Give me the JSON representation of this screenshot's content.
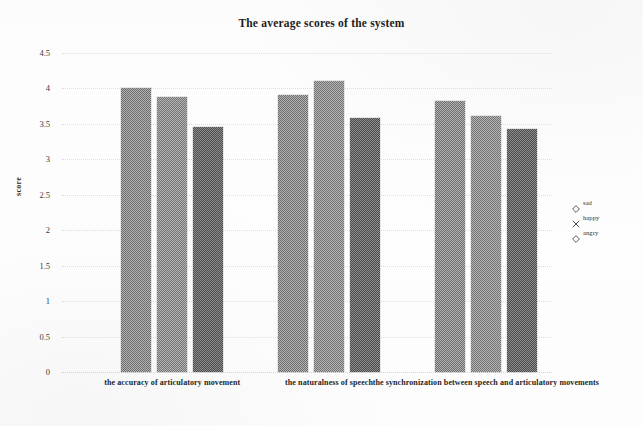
{
  "chart_data": {
    "type": "bar",
    "title": "The average scores of the system",
    "xlabel": "",
    "ylabel": "score",
    "ylim": [
      0,
      4.5
    ],
    "ytick_labels": [
      "4.5",
      "4",
      "3.5",
      "3",
      "2.5",
      "2",
      "1.5",
      "1",
      "0.5",
      "0"
    ],
    "yticks": [
      4.5,
      4,
      3.5,
      3,
      2.5,
      2,
      1.5,
      1,
      0.5,
      0
    ],
    "grid": true,
    "legend_position": "right",
    "categories": [
      "the accuracy of articulatory movement",
      "the naturalness of speech",
      "the synchronization between speech and articulatory movements"
    ],
    "series": [
      {
        "name": "sad",
        "marker": "diamond-marker",
        "values": [
          4.01,
          3.91,
          3.82
        ]
      },
      {
        "name": "happy",
        "marker": "cross-marker",
        "values": [
          3.88,
          4.1,
          3.61
        ]
      },
      {
        "name": "angry",
        "marker": "diamond-marker",
        "values": [
          3.46,
          3.59,
          3.43
        ]
      }
    ]
  },
  "legend": {
    "entries": [
      {
        "label": "sad",
        "marker": "diamond-marker"
      },
      {
        "label": "happy",
        "marker": "cross-marker"
      },
      {
        "label": "angry",
        "marker": "diamond-marker"
      }
    ]
  }
}
